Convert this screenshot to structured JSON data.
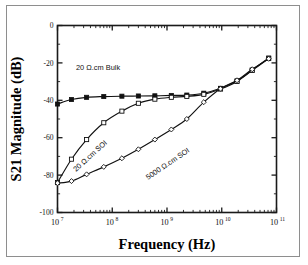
{
  "figure": {
    "background_color": "#ffffff",
    "frame_color": "#8e8e8e",
    "ink_color": "#111111"
  },
  "chart_data": {
    "type": "line",
    "title": "",
    "subtitle": "",
    "xlabel": "Frequency (Hz)",
    "ylabel": "S21 Magnitude (dB)",
    "xscale": "log",
    "yscale": "linear",
    "xlim": [
      10000000,
      100000000000
    ],
    "ylim": [
      -100,
      0
    ],
    "grid": false,
    "legend_position": "inline-annotations",
    "xticks": [
      {
        "value": 10000000,
        "label": "10",
        "exponent": "7"
      },
      {
        "value": 100000000,
        "label": "10",
        "exponent": "8"
      },
      {
        "value": 1000000000,
        "label": "10",
        "exponent": "9"
      },
      {
        "value": 10000000000,
        "label": "10",
        "exponent": "10"
      },
      {
        "value": 100000000000,
        "label": "10",
        "exponent": "11"
      }
    ],
    "yticks": [
      {
        "value": 0,
        "label": "0"
      },
      {
        "value": -20,
        "label": "-20"
      },
      {
        "value": -40,
        "label": "-40"
      },
      {
        "value": -60,
        "label": "-60"
      },
      {
        "value": -80,
        "label": "-80"
      },
      {
        "value": -100,
        "label": "-100"
      }
    ],
    "series": [
      {
        "name": "20 Ω.cm Bulk",
        "marker": "filled-square",
        "annotation": "20 Ω.cm Bulk",
        "annotation_rotation": 0,
        "x": [
          10000000.0,
          18000000.0,
          34000000.0,
          70000000.0,
          150000000.0,
          300000000.0,
          600000000.0,
          1200000000.0,
          2300000000.0,
          4700000000.0,
          9500000000.0,
          19000000000.0,
          36000000000.0,
          72000000000.0
        ],
        "y": [
          -42.0,
          -39.6,
          -38.4,
          -38.0,
          -37.8,
          -37.7,
          -37.6,
          -37.4,
          -37.2,
          -36.2,
          -33.6,
          -29.6,
          -23.8,
          -17.4
        ]
      },
      {
        "name": "20 Ω.cm SOI",
        "marker": "open-square",
        "annotation": "20 Ω.cm SOI",
        "annotation_rotation": -42,
        "x": [
          10000000.0,
          18000000.0,
          34000000.0,
          70000000.0,
          150000000.0,
          300000000.0,
          600000000.0,
          1200000000.0,
          2300000000.0,
          4700000000.0,
          9500000000.0,
          19000000000.0,
          36000000000.0,
          72000000000.0
        ],
        "y": [
          -84.0,
          -71.5,
          -61.0,
          -52.0,
          -45.8,
          -41.6,
          -39.4,
          -38.4,
          -37.9,
          -36.8,
          -34.0,
          -29.9,
          -24.0,
          -17.6
        ]
      },
      {
        "name": "5000 Ω.cm SOI",
        "marker": "open-diamond",
        "annotation": "5000 Ω.cm SOI",
        "annotation_rotation": -34,
        "x": [
          10000000.0,
          18000000.0,
          34000000.0,
          70000000.0,
          150000000.0,
          300000000.0,
          600000000.0,
          1200000000.0,
          2300000000.0,
          4700000000.0,
          9500000000.0,
          19000000000.0,
          36000000000.0,
          72000000000.0
        ],
        "y": [
          -84.3,
          -83.2,
          -79.6,
          -75.6,
          -71.0,
          -66.2,
          -61.0,
          -55.6,
          -50.0,
          -41.0,
          -33.8,
          -29.3,
          -23.4,
          -17.8
        ]
      }
    ]
  }
}
